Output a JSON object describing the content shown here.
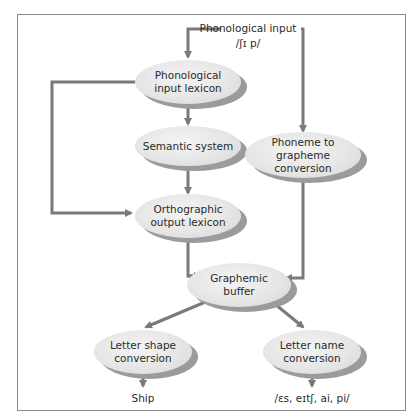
{
  "diagram": {
    "input": {
      "label": "Phonological input",
      "phonetic": "/ʃɪ p/"
    },
    "nodes": {
      "phonological_input_lexicon": "Phonological input lexicon",
      "semantic_system": "Semantic system",
      "orthographic_output_lexicon": "Orthographic output lexicon",
      "phoneme_to_grapheme": "Phoneme to grapheme conversion",
      "graphemic_buffer": "Graphemic buffer",
      "letter_shape_conversion": "Letter shape conversion",
      "letter_name_conversion": "Letter name conversion"
    },
    "outputs": {
      "written": "Ship",
      "spoken_letters": "/ɛs, eɪtʃ, ai, pi/"
    },
    "edges": [
      {
        "from": "Phonological input",
        "to": "Phonological input lexicon"
      },
      {
        "from": "Phonological input",
        "to": "Phoneme to grapheme conversion"
      },
      {
        "from": "Phonological input lexicon",
        "to": "Semantic system"
      },
      {
        "from": "Phonological input lexicon",
        "to": "Orthographic output lexicon"
      },
      {
        "from": "Semantic system",
        "to": "Orthographic output lexicon"
      },
      {
        "from": "Orthographic output lexicon",
        "to": "Graphemic buffer"
      },
      {
        "from": "Phoneme to grapheme conversion",
        "to": "Graphemic buffer"
      },
      {
        "from": "Graphemic buffer",
        "to": "Letter shape conversion"
      },
      {
        "from": "Graphemic buffer",
        "to": "Letter name conversion"
      },
      {
        "from": "Letter shape conversion",
        "to": "Ship"
      },
      {
        "from": "Letter name conversion",
        "to": "/ɛs, eɪtʃ, ai, pi/"
      }
    ],
    "colors": {
      "frame": "#8a8a8a",
      "arrow": "#7a7a7a",
      "node_fill": "#e6e6e6",
      "node_shadow": "#9b9b9b",
      "text": "#2a2a2a"
    }
  }
}
